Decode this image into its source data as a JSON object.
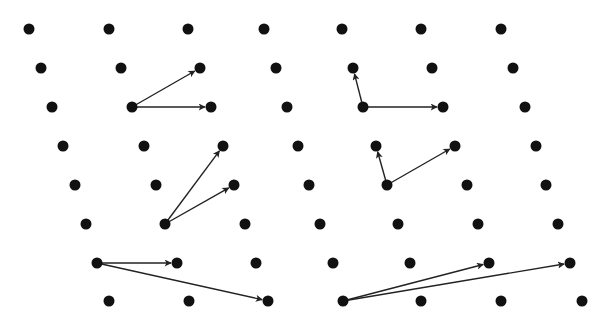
{
  "diagram": {
    "colors": {
      "point": "#111111",
      "arrow": "#222222",
      "background": "#ffffff"
    },
    "point_radius": 5.5,
    "rows": [
      {
        "y": 29,
        "xs": [
          29,
          109,
          188,
          264,
          342,
          421,
          501
        ]
      },
      {
        "y": 68,
        "xs": [
          41,
          121,
          200,
          276,
          353,
          432,
          513
        ]
      },
      {
        "y": 107,
        "xs": [
          52,
          132,
          211,
          287,
          363,
          443,
          525
        ]
      },
      {
        "y": 146,
        "xs": [
          63,
          144,
          223,
          298,
          376,
          455,
          536
        ]
      },
      {
        "y": 185,
        "xs": [
          75,
          156,
          234,
          309,
          387,
          467,
          546
        ]
      },
      {
        "y": 224,
        "xs": [
          86,
          165,
          245,
          320,
          398,
          478,
          558
        ]
      },
      {
        "y": 263,
        "xs": [
          97,
          177,
          256,
          333,
          410,
          489,
          570
        ]
      },
      {
        "y": 301,
        "xs": [
          109,
          189,
          268,
          343,
          421,
          501,
          582
        ]
      }
    ],
    "basis_pairs": [
      {
        "name": "basis-pair-1",
        "origin": [
          132,
          107
        ],
        "vectors": [
          [
            200,
            68
          ],
          [
            211,
            107
          ]
        ]
      },
      {
        "name": "basis-pair-2",
        "origin": [
          363,
          107
        ],
        "vectors": [
          [
            353,
            68
          ],
          [
            443,
            107
          ]
        ]
      },
      {
        "name": "basis-pair-3",
        "origin": [
          165,
          224
        ],
        "vectors": [
          [
            223,
            146
          ],
          [
            234,
            185
          ]
        ]
      },
      {
        "name": "basis-pair-4",
        "origin": [
          387,
          185
        ],
        "vectors": [
          [
            376,
            146
          ],
          [
            455,
            146
          ]
        ]
      },
      {
        "name": "basis-pair-5",
        "origin": [
          97,
          263
        ],
        "vectors": [
          [
            177,
            263
          ],
          [
            268,
            301
          ]
        ]
      },
      {
        "name": "basis-pair-6",
        "origin": [
          343,
          301
        ],
        "vectors": [
          [
            489,
            263
          ],
          [
            570,
            263
          ]
        ]
      }
    ]
  }
}
